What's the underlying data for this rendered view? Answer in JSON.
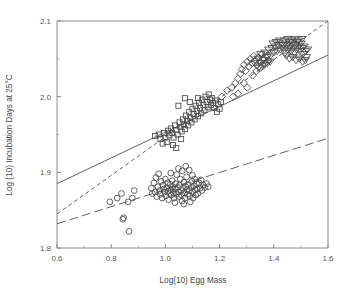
{
  "chart_data": {
    "type": "scatter",
    "title": "",
    "xlabel": "Log(10) Egg Mass",
    "ylabel": "Log (10) Incubation Days at 25°C",
    "xlim": [
      0.6,
      1.6
    ],
    "ylim": [
      1.8,
      2.1
    ],
    "xticks": [
      0.6,
      0.8,
      1.0,
      1.2,
      1.4,
      1.6
    ],
    "xtick_labels": [
      "0.6",
      "0.8",
      "1.0",
      "1.2",
      "1.4",
      "1.6"
    ],
    "xticks_minor": [
      0.7,
      0.9,
      1.1,
      1.3,
      1.5
    ],
    "yticks": [
      1.8,
      1.9,
      2.0,
      2.1
    ],
    "ytick_labels": [
      "1.8",
      "1.9",
      "2.0",
      "2.1"
    ],
    "yticks_minor": [
      1.85,
      1.95,
      2.05
    ],
    "grid": false,
    "legend_position": "none",
    "series": [
      {
        "name": "circles",
        "marker": "circle",
        "points": [
          [
            0.795,
            1.861
          ],
          [
            0.822,
            1.866
          ],
          [
            0.838,
            1.872
          ],
          [
            0.843,
            1.838
          ],
          [
            0.846,
            1.84
          ],
          [
            0.862,
            1.861
          ],
          [
            0.866,
            1.822
          ],
          [
            0.878,
            1.866
          ],
          [
            0.885,
            1.876
          ],
          [
            0.948,
            1.879
          ],
          [
            0.952,
            1.872
          ],
          [
            0.958,
            1.886
          ],
          [
            0.962,
            1.874
          ],
          [
            0.965,
            1.893
          ],
          [
            0.968,
            1.868
          ],
          [
            0.972,
            1.881
          ],
          [
            0.975,
            1.898
          ],
          [
            0.978,
            1.876
          ],
          [
            0.981,
            1.871
          ],
          [
            0.984,
            1.888
          ],
          [
            0.988,
            1.866
          ],
          [
            0.991,
            1.883
          ],
          [
            0.994,
            1.878
          ],
          [
            0.997,
            1.874
          ],
          [
            1.0,
            1.891
          ],
          [
            1.002,
            1.869
          ],
          [
            1.005,
            1.88
          ],
          [
            1.008,
            1.886
          ],
          [
            1.01,
            1.875
          ],
          [
            1.012,
            1.864
          ],
          [
            1.015,
            1.872
          ],
          [
            1.018,
            1.884
          ],
          [
            1.02,
            1.877
          ],
          [
            1.022,
            1.87
          ],
          [
            1.025,
            1.889
          ],
          [
            1.028,
            1.881
          ],
          [
            1.03,
            1.873
          ],
          [
            1.032,
            1.866
          ],
          [
            1.035,
            1.878
          ],
          [
            1.038,
            1.885
          ],
          [
            1.04,
            1.871
          ],
          [
            1.042,
            1.897
          ],
          [
            1.045,
            1.88
          ],
          [
            1.048,
            1.874
          ],
          [
            1.05,
            1.868
          ],
          [
            1.052,
            1.883
          ],
          [
            1.055,
            1.891
          ],
          [
            1.058,
            1.876
          ],
          [
            1.06,
            1.87
          ],
          [
            1.062,
            1.862
          ],
          [
            1.065,
            1.879
          ],
          [
            1.068,
            1.887
          ],
          [
            1.07,
            1.873
          ],
          [
            1.072,
            1.866
          ],
          [
            1.075,
            1.881
          ],
          [
            1.078,
            1.894
          ],
          [
            1.08,
            1.877
          ],
          [
            1.082,
            1.871
          ],
          [
            1.085,
            1.884
          ],
          [
            1.088,
            1.876
          ],
          [
            1.09,
            1.869
          ],
          [
            1.092,
            1.861
          ],
          [
            1.095,
            1.88
          ],
          [
            1.098,
            1.888
          ],
          [
            1.1,
            1.874
          ],
          [
            1.102,
            1.866
          ],
          [
            1.105,
            1.882
          ],
          [
            1.108,
            1.891
          ],
          [
            1.11,
            1.877
          ],
          [
            1.112,
            1.87
          ],
          [
            1.115,
            1.885
          ],
          [
            1.118,
            1.878
          ],
          [
            1.12,
            1.872
          ],
          [
            1.125,
            1.886
          ],
          [
            1.128,
            1.879
          ],
          [
            1.132,
            1.89
          ],
          [
            1.135,
            1.876
          ],
          [
            1.14,
            1.883
          ],
          [
            1.145,
            1.88
          ],
          [
            1.152,
            1.885
          ],
          [
            1.158,
            1.881
          ],
          [
            1.048,
            1.905
          ],
          [
            1.062,
            1.902
          ],
          [
            1.075,
            1.908
          ],
          [
            1.088,
            1.903
          ],
          [
            1.02,
            1.899
          ],
          [
            1.1,
            1.896
          ],
          [
            1.035,
            1.86
          ],
          [
            1.068,
            1.858
          ]
        ]
      },
      {
        "name": "squares",
        "marker": "square",
        "points": [
          [
            0.962,
            1.948
          ],
          [
            0.975,
            1.95
          ],
          [
            0.982,
            1.944
          ],
          [
            0.99,
            1.938
          ],
          [
            0.995,
            1.952
          ],
          [
            1.0,
            1.946
          ],
          [
            1.005,
            1.94
          ],
          [
            1.01,
            1.955
          ],
          [
            1.015,
            1.949
          ],
          [
            1.02,
            1.958
          ],
          [
            1.025,
            1.952
          ],
          [
            1.03,
            1.946
          ],
          [
            1.035,
            1.962
          ],
          [
            1.04,
            1.956
          ],
          [
            1.045,
            1.95
          ],
          [
            1.048,
            1.988
          ],
          [
            1.052,
            1.966
          ],
          [
            1.056,
            1.96
          ],
          [
            1.06,
            1.954
          ],
          [
            1.065,
            1.97
          ],
          [
            1.068,
            1.963
          ],
          [
            1.072,
            1.957
          ],
          [
            1.076,
            1.975
          ],
          [
            1.08,
            1.968
          ],
          [
            1.084,
            1.962
          ],
          [
            1.088,
            1.98
          ],
          [
            1.092,
            1.972
          ],
          [
            1.096,
            1.966
          ],
          [
            1.1,
            1.984
          ],
          [
            1.104,
            1.977
          ],
          [
            1.108,
            1.97
          ],
          [
            1.112,
            1.988
          ],
          [
            1.116,
            1.981
          ],
          [
            1.12,
            1.974
          ],
          [
            1.124,
            1.992
          ],
          [
            1.128,
            1.985
          ],
          [
            1.132,
            1.978
          ],
          [
            1.136,
            1.996
          ],
          [
            1.14,
            1.989
          ],
          [
            1.144,
            1.982
          ],
          [
            1.148,
            2.0
          ],
          [
            1.152,
            1.993
          ],
          [
            1.156,
            1.986
          ],
          [
            1.16,
            2.003
          ],
          [
            1.164,
            1.996
          ],
          [
            1.168,
            1.989
          ],
          [
            1.172,
            1.998
          ],
          [
            1.176,
            1.992
          ],
          [
            1.18,
            1.985
          ],
          [
            1.185,
            1.995
          ],
          [
            1.19,
            1.98
          ],
          [
            1.195,
            1.99
          ],
          [
            1.2,
            1.984
          ],
          [
            1.205,
            1.993
          ],
          [
            1.04,
            1.932
          ],
          [
            1.028,
            1.936
          ],
          [
            1.12,
            1.998
          ],
          [
            1.09,
            1.993
          ],
          [
            1.072,
            1.998
          ],
          [
            1.058,
            1.944
          ]
        ]
      },
      {
        "name": "diamonds",
        "marker": "diamond",
        "points": [
          [
            1.208,
            2.0
          ],
          [
            1.228,
            2.008
          ],
          [
            1.245,
            2.012
          ],
          [
            1.258,
            2.018
          ],
          [
            1.268,
            2.024
          ],
          [
            1.276,
            2.03
          ],
          [
            1.282,
            2.036
          ],
          [
            1.29,
            2.042
          ],
          [
            1.296,
            2.034
          ],
          [
            1.302,
            2.046
          ],
          [
            1.308,
            2.04
          ],
          [
            1.314,
            2.05
          ],
          [
            1.32,
            2.044
          ],
          [
            1.326,
            2.054
          ],
          [
            1.332,
            2.048
          ],
          [
            1.338,
            2.042
          ],
          [
            1.344,
            2.052
          ],
          [
            1.35,
            2.046
          ],
          [
            1.356,
            2.056
          ],
          [
            1.362,
            2.05
          ],
          [
            1.368,
            2.044
          ],
          [
            1.374,
            2.054
          ],
          [
            1.38,
            2.048
          ],
          [
            1.29,
            2.018
          ],
          [
            1.302,
            2.012
          ],
          [
            1.268,
            2.004
          ],
          [
            1.25,
            2.0
          ],
          [
            1.322,
            2.028
          ],
          [
            1.336,
            2.034
          ],
          [
            1.352,
            2.038
          ]
        ]
      },
      {
        "name": "triangles",
        "marker": "triangle-down",
        "points": [
          [
            1.33,
            2.044
          ],
          [
            1.342,
            2.05
          ],
          [
            1.352,
            2.056
          ],
          [
            1.36,
            2.048
          ],
          [
            1.368,
            2.058
          ],
          [
            1.375,
            2.052
          ],
          [
            1.382,
            2.062
          ],
          [
            1.388,
            2.054
          ],
          [
            1.394,
            2.064
          ],
          [
            1.4,
            2.058
          ],
          [
            1.406,
            2.066
          ],
          [
            1.412,
            2.06
          ],
          [
            1.418,
            2.068
          ],
          [
            1.424,
            2.062
          ],
          [
            1.43,
            2.07
          ],
          [
            1.436,
            2.064
          ],
          [
            1.442,
            2.058
          ],
          [
            1.448,
            2.068
          ],
          [
            1.452,
            2.062
          ],
          [
            1.456,
            2.072
          ],
          [
            1.46,
            2.066
          ],
          [
            1.464,
            2.06
          ],
          [
            1.468,
            2.07
          ],
          [
            1.472,
            2.064
          ],
          [
            1.476,
            2.058
          ],
          [
            1.48,
            2.068
          ],
          [
            1.484,
            2.062
          ],
          [
            1.488,
            2.072
          ],
          [
            1.492,
            2.066
          ],
          [
            1.496,
            2.06
          ],
          [
            1.5,
            2.07
          ],
          [
            1.504,
            2.064
          ],
          [
            1.508,
            2.056
          ],
          [
            1.512,
            2.066
          ],
          [
            1.516,
            2.06
          ],
          [
            1.52,
            2.052
          ],
          [
            1.524,
            2.062
          ],
          [
            1.44,
            2.074
          ],
          [
            1.452,
            2.076
          ],
          [
            1.466,
            2.074
          ],
          [
            1.478,
            2.076
          ],
          [
            1.49,
            2.074
          ],
          [
            1.504,
            2.076
          ],
          [
            1.398,
            2.07
          ],
          [
            1.41,
            2.072
          ],
          [
            1.422,
            2.074
          ],
          [
            1.434,
            2.068
          ],
          [
            1.446,
            2.054
          ],
          [
            1.458,
            2.05
          ],
          [
            1.47,
            2.052
          ],
          [
            1.482,
            2.048
          ],
          [
            1.494,
            2.05
          ],
          [
            1.506,
            2.046
          ],
          [
            1.516,
            2.048
          ],
          [
            1.344,
            2.038
          ],
          [
            1.356,
            2.04
          ],
          [
            1.366,
            2.042
          ],
          [
            1.376,
            2.044
          ],
          [
            1.386,
            2.046
          ]
        ]
      }
    ],
    "lines": [
      {
        "name": "solid-fit",
        "style": "solid",
        "x0": 0.6,
        "y0": 1.885,
        "x1": 1.6,
        "y1": 2.055
      },
      {
        "name": "short-dash-fit",
        "style": "short-dash",
        "x0": 0.6,
        "y0": 1.845,
        "x1": 1.6,
        "y1": 2.1
      },
      {
        "name": "long-dash-fit",
        "style": "long-dash",
        "x0": 0.6,
        "y0": 1.832,
        "x1": 1.6,
        "y1": 1.945
      }
    ]
  }
}
